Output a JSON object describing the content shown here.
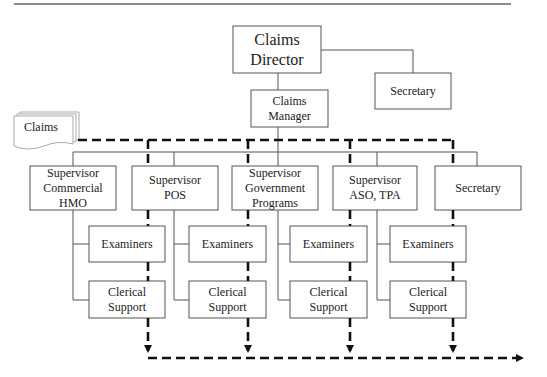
{
  "diagram": {
    "type": "org-chart-with-claims-flow",
    "nodes": {
      "director": "Claims Director",
      "director_secretary": "Secretary",
      "manager": "Claims Manager",
      "claims_input": "Claims",
      "supervisors": [
        "Supervisor\nCommercial HMO",
        "Supervisor\nPOS",
        "Supervisor\nGovernment\nPrograms",
        "Supervisor\nASO, TPA",
        "Secretary"
      ],
      "examiners": [
        "Examiners",
        "Examiners",
        "Examiners",
        "Examiners"
      ],
      "clerical": [
        "Clerical\nSupport",
        "Clerical\nSupport",
        "Clerical\nSupport",
        "Clerical\nSupport"
      ]
    },
    "edges": [
      {
        "from": "Claims Director",
        "to": "Secretary",
        "style": "solid"
      },
      {
        "from": "Claims Director",
        "to": "Claims Manager",
        "style": "solid"
      },
      {
        "from": "Claims Manager",
        "to": "Supervisors",
        "style": "solid"
      },
      {
        "from": "Claims",
        "to": "Examiners / Clerical Support",
        "style": "dashed-bold",
        "meaning": "claims flow"
      },
      {
        "from": "Clerical Support",
        "to": "output",
        "style": "dashed-bold-arrow"
      }
    ],
    "colors": {
      "line": "#555555",
      "flow": "#111111",
      "box_border": "#555555"
    }
  }
}
